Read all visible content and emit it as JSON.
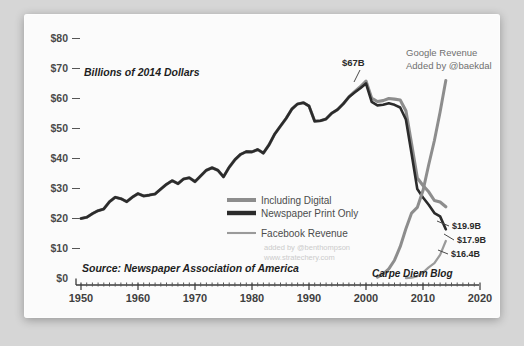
{
  "chart_data": {
    "type": "line",
    "title": "",
    "subtitle": "Billions of 2014 Dollars",
    "source_note": "Source: Newspaper Association of America",
    "xlabel": "",
    "ylabel": "Billions of 2014 Dollars",
    "xlim": [
      1950,
      2020
    ],
    "ylim": [
      0,
      80
    ],
    "grid": false,
    "legend_position": "center-right",
    "y_ticks": [
      "$0",
      "$10",
      "$20",
      "$30",
      "$40",
      "$50",
      "$60",
      "$70",
      "$80"
    ],
    "y_tick_values": [
      0,
      10,
      20,
      30,
      40,
      50,
      60,
      70,
      80
    ],
    "x_ticks": [
      "1950",
      "1960",
      "1970",
      "1980",
      "1990",
      "2000",
      "2010",
      "2020"
    ],
    "x_tick_values": [
      1950,
      1960,
      1970,
      1980,
      1990,
      2000,
      2010,
      2020
    ],
    "series": [
      {
        "name": "Including Digital",
        "color": "#8d8d8d",
        "x": [
          1950,
          1951,
          1952,
          1953,
          1954,
          1955,
          1956,
          1957,
          1958,
          1959,
          1960,
          1961,
          1962,
          1963,
          1964,
          1965,
          1966,
          1967,
          1968,
          1969,
          1970,
          1971,
          1972,
          1973,
          1974,
          1975,
          1976,
          1977,
          1978,
          1979,
          1980,
          1981,
          1982,
          1983,
          1984,
          1985,
          1986,
          1987,
          1988,
          1989,
          1990,
          1991,
          1992,
          1993,
          1994,
          1995,
          1996,
          1997,
          1998,
          1999,
          2000,
          2001,
          2002,
          2003,
          2004,
          2005,
          2006,
          2007,
          2008,
          2009,
          2010,
          2011,
          2012,
          2013,
          2014
        ],
        "values": [
          20.0,
          20.4,
          21.6,
          22.6,
          23.2,
          25.6,
          27.1,
          26.6,
          25.6,
          27.1,
          28.3,
          27.5,
          27.8,
          28.2,
          29.8,
          31.4,
          32.6,
          31.6,
          33.2,
          33.6,
          32.3,
          34.2,
          36.1,
          36.9,
          36.1,
          33.9,
          37.1,
          39.6,
          41.4,
          42.3,
          42.2,
          43.0,
          41.8,
          44.6,
          48.2,
          50.8,
          53.4,
          56.5,
          58.2,
          58.6,
          57.5,
          52.4,
          52.6,
          53.2,
          55.1,
          56.3,
          58.2,
          60.5,
          62.3,
          63.9,
          65.8,
          60.1,
          59.0,
          59.3,
          60.0,
          59.8,
          59.5,
          55.9,
          44.8,
          33.5,
          31.0,
          28.9,
          26.0,
          25.5,
          23.9
        ]
      },
      {
        "name": "Newspaper Print Only",
        "color": "#2b2b2b",
        "x": [
          1950,
          1951,
          1952,
          1953,
          1954,
          1955,
          1956,
          1957,
          1958,
          1959,
          1960,
          1961,
          1962,
          1963,
          1964,
          1965,
          1966,
          1967,
          1968,
          1969,
          1970,
          1971,
          1972,
          1973,
          1974,
          1975,
          1976,
          1977,
          1978,
          1979,
          1980,
          1981,
          1982,
          1983,
          1984,
          1985,
          1986,
          1987,
          1988,
          1989,
          1990,
          1991,
          1992,
          1993,
          1994,
          1995,
          1996,
          1997,
          1998,
          1999,
          2000,
          2001,
          2002,
          2003,
          2004,
          2005,
          2006,
          2007,
          2008,
          2009,
          2010,
          2011,
          2012,
          2013,
          2014
        ],
        "values": [
          20.0,
          20.4,
          21.6,
          22.6,
          23.2,
          25.6,
          27.1,
          26.6,
          25.6,
          27.1,
          28.3,
          27.5,
          27.8,
          28.2,
          29.8,
          31.4,
          32.6,
          31.6,
          33.2,
          33.6,
          32.3,
          34.2,
          36.1,
          36.9,
          36.1,
          33.9,
          37.1,
          39.6,
          41.4,
          42.3,
          42.2,
          43.0,
          41.8,
          44.6,
          48.2,
          50.8,
          53.4,
          56.5,
          58.2,
          58.6,
          57.5,
          52.4,
          52.6,
          53.2,
          55.1,
          56.3,
          58.2,
          60.5,
          62.0,
          63.4,
          65.0,
          58.9,
          57.7,
          57.9,
          58.4,
          57.9,
          57.0,
          53.0,
          41.6,
          29.8,
          27.0,
          24.6,
          21.8,
          20.7,
          16.4
        ]
      },
      {
        "name": "Google Revenue",
        "color": "#8d8d8d",
        "x": [
          2002,
          2003,
          2004,
          2005,
          2006,
          2007,
          2008,
          2009,
          2010,
          2011,
          2012,
          2013,
          2014
        ],
        "values": [
          0.4,
          1.5,
          3.2,
          6.1,
          10.6,
          16.6,
          21.8,
          23.7,
          29.3,
          37.9,
          46.0,
          55.5,
          66.0
        ]
      },
      {
        "name": "Facebook Revenue",
        "color": "#9a9a9a",
        "x": [
          2007,
          2008,
          2009,
          2010,
          2011,
          2012,
          2013,
          2014
        ],
        "values": [
          0.15,
          0.27,
          0.78,
          2.0,
          3.7,
          5.1,
          7.9,
          12.5
        ]
      }
    ],
    "legend": [
      {
        "label": "Including Digital",
        "color": "#8d8d8d",
        "style": "thick"
      },
      {
        "label": "Newspaper Print Only",
        "color": "#2b2b2b",
        "style": "thick"
      },
      {
        "label": "Facebook Revenue",
        "color": "#9a9a9a",
        "style": "thin"
      }
    ],
    "annotations": {
      "peak_label": "$67B",
      "google_title": "Google Revenue",
      "google_credit": "Added by @baekdal",
      "blog_tag": "Carpe Diem Blog",
      "attribution_line1": "added by @benthompson",
      "attribution_line2": "www.stratechery.com",
      "end_labels": [
        {
          "text": "$19.9B"
        },
        {
          "text": "$17.9B"
        },
        {
          "text": "$16.4B"
        }
      ]
    }
  }
}
